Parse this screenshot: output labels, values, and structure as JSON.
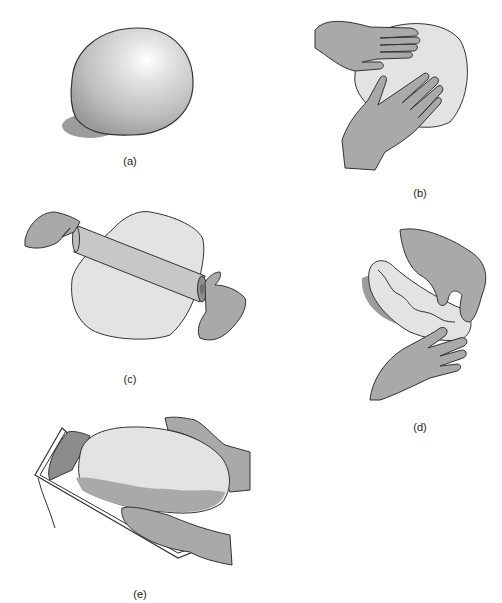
{
  "figure": {
    "panels": [
      {
        "id": "a",
        "label": "(a)",
        "depicts": "round ball of dough"
      },
      {
        "id": "b",
        "label": "(b)",
        "depicts": "two hands flattening the dough ball"
      },
      {
        "id": "c",
        "label": "(c)",
        "depicts": "rolling pin flattening dough into a sheet"
      },
      {
        "id": "d",
        "label": "(d)",
        "depicts": "hands rolling the dough sheet into a log"
      },
      {
        "id": "e",
        "label": "(e)",
        "depicts": "hands placing shaped loaf into a loaf pan"
      }
    ],
    "colors": {
      "dough": "#e2e2e2",
      "dough_shadow": "#a8a8a8",
      "hand": "#a9a9a9",
      "outline": "#333333",
      "background": "#ffffff"
    }
  }
}
